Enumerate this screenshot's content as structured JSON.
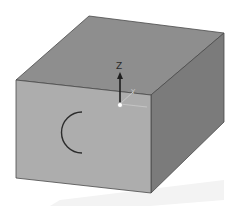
{
  "viewport": {
    "background": "#ffffff",
    "model": {
      "type": "box",
      "faces": {
        "top": {
          "color": "#8e8e8e",
          "points": "89,16 224,33 151,95 16,80"
        },
        "front": {
          "color": "#adadad",
          "points": "16,80 151,95 151,193 16,178"
        },
        "right": {
          "color": "#7a7a7a",
          "points": "151,95 224,33 224,122 151,193"
        }
      },
      "edge_color": "#4a4a4a",
      "arc_sketch": {
        "color": "#2b2b2b"
      }
    },
    "shadow": {
      "color": "#f2f2f2"
    },
    "triad": {
      "z_label": "Z",
      "y_label": "Y",
      "x_label": "X",
      "z_color": "#1e1e1e",
      "minor_color": "#c0c0c0",
      "origin_color": "#ffffff"
    }
  }
}
